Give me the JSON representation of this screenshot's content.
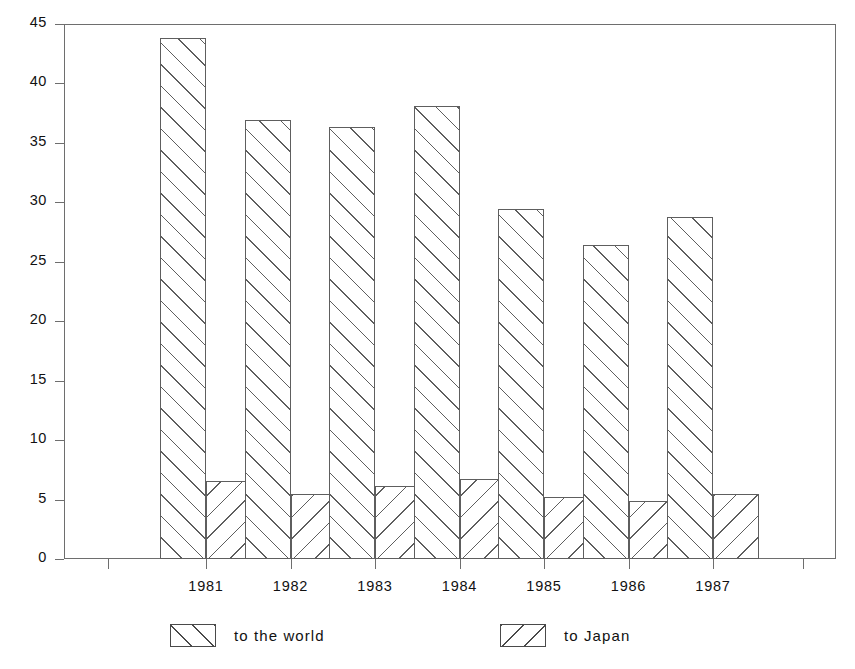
{
  "chart_data": {
    "type": "bar",
    "title": "",
    "subtitle": "",
    "xlabel": "",
    "ylabel": "",
    "categories": [
      "1981",
      "1982",
      "1983",
      "1984",
      "1985",
      "1986",
      "1987"
    ],
    "series": [
      {
        "name": "to the world",
        "pattern": "diagonal-forward-hatch",
        "values": [
          43.8,
          36.9,
          36.3,
          38.1,
          29.4,
          26.4,
          28.8
        ]
      },
      {
        "name": "to Japan",
        "pattern": "diagonal-backward-hatch",
        "values": [
          6.6,
          5.5,
          6.1,
          6.7,
          5.2,
          4.9,
          5.5
        ]
      }
    ],
    "ylim": [
      0,
      45
    ],
    "ytick_labels": [
      "0",
      "5",
      "10",
      "15",
      "20",
      "25",
      "30",
      "35",
      "40",
      "45"
    ],
    "ytick_values": [
      0,
      5,
      10,
      15,
      20,
      25,
      30,
      35,
      40,
      45
    ],
    "grid": false,
    "legend_position": "bottom",
    "frame": "box",
    "colors": {
      "line": "#5e5e5e",
      "text": "#111111",
      "background": "#ffffff"
    }
  },
  "legend": {
    "items": [
      {
        "label": "to the world"
      },
      {
        "label": "to Japan"
      }
    ]
  }
}
